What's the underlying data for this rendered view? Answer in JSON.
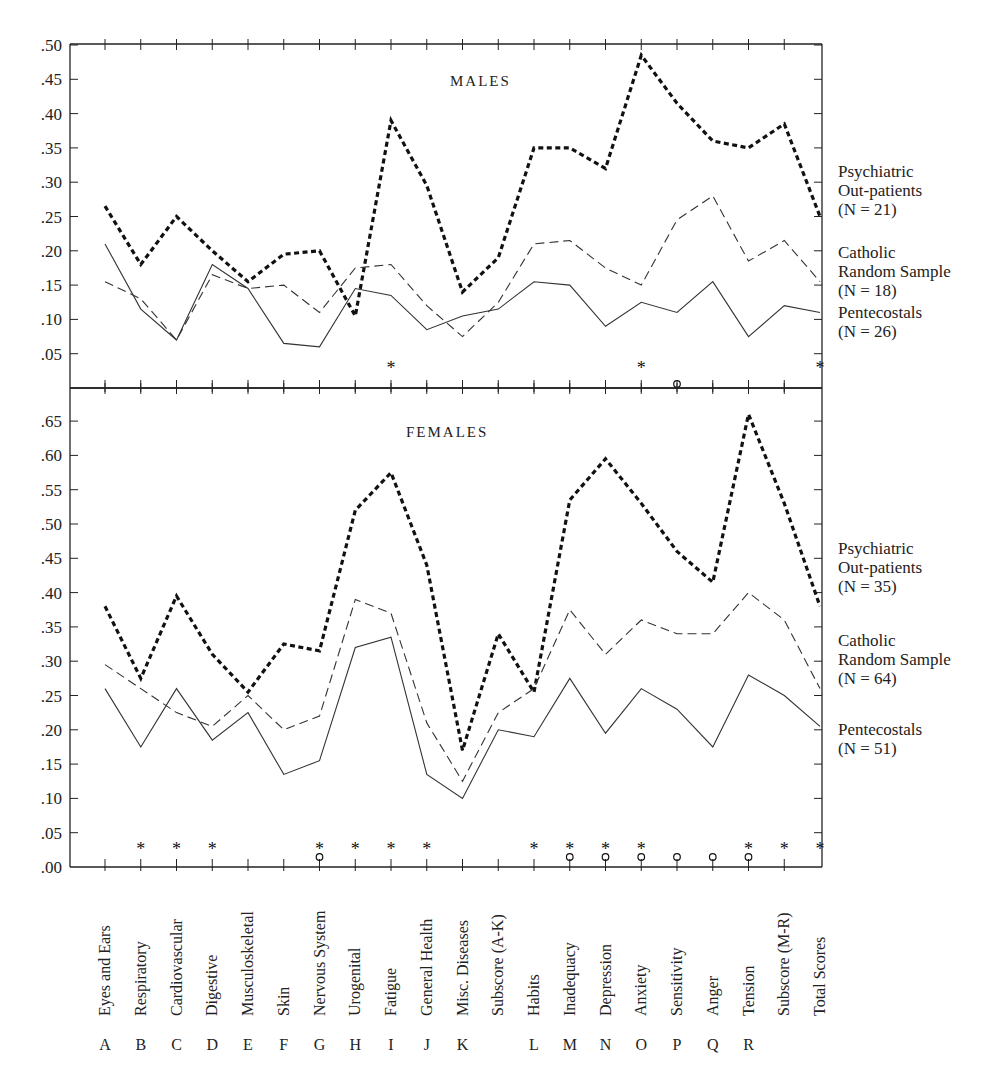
{
  "chart_data": [
    {
      "type": "line",
      "title": "MALES",
      "categories": [
        "Eyes and Ears",
        "Respiratory",
        "Cardiovascular",
        "Digestive",
        "Musculoskeletal",
        "Skin",
        "Nervous System",
        "Urogenital",
        "Fatigue",
        "General Health",
        "Misc. Diseases",
        "Subscore (A-K)",
        "Habits",
        "Inadequacy",
        "Depression",
        "Anxiety",
        "Sensitivity",
        "Anger",
        "Tension",
        "Subscore (M-R)",
        "Total Scores"
      ],
      "letters": [
        "A",
        "B",
        "C",
        "D",
        "E",
        "F",
        "G",
        "H",
        "I",
        "J",
        "K",
        "",
        "L",
        "M",
        "N",
        "O",
        "P",
        "Q",
        "R",
        "",
        ""
      ],
      "yticks": [
        ".05",
        ".10",
        ".15",
        ".20",
        ".25",
        ".30",
        ".35",
        ".40",
        ".45",
        ".50"
      ],
      "ylim": [
        0,
        0.5
      ],
      "series": [
        {
          "name": "Psychiatric Out-patients",
          "n_label": "(N = 21)",
          "line1": "Psychiatric",
          "line2": "Out-patients",
          "style": "heavy-dotted",
          "values": [
            0.265,
            0.18,
            0.25,
            0.2,
            0.155,
            0.195,
            0.2,
            0.105,
            0.39,
            0.295,
            0.14,
            0.19,
            0.35,
            0.35,
            0.32,
            0.485,
            0.415,
            0.36,
            0.35,
            0.385,
            0.25
          ]
        },
        {
          "name": "Catholic Random Sample",
          "n_label": "(N = 18)",
          "line1": "Catholic",
          "line2": "Random Sample",
          "style": "dashed",
          "values": [
            0.155,
            0.13,
            0.07,
            0.165,
            0.145,
            0.15,
            0.11,
            0.175,
            0.18,
            0.12,
            0.075,
            0.125,
            0.21,
            0.215,
            0.175,
            0.15,
            0.245,
            0.28,
            0.185,
            0.215,
            0.155
          ]
        },
        {
          "name": "Pentecostals",
          "n_label": "(N = 26)",
          "line1": "Pentecostals",
          "line2": "",
          "style": "solid",
          "values": [
            0.21,
            0.115,
            0.07,
            0.18,
            0.145,
            0.065,
            0.06,
            0.145,
            0.135,
            0.085,
            0.105,
            0.115,
            0.155,
            0.15,
            0.09,
            0.125,
            0.11,
            0.155,
            0.075,
            0.12,
            0.11
          ]
        }
      ],
      "significance": {
        "asterisk": [
          "Fatigue",
          "Anxiety",
          "Total Scores"
        ],
        "circle": [
          "Sensitivity"
        ]
      }
    },
    {
      "type": "line",
      "title": "FEMALES",
      "categories": [
        "Eyes and Ears",
        "Respiratory",
        "Cardiovascular",
        "Digestive",
        "Musculoskeletal",
        "Skin",
        "Nervous System",
        "Urogenital",
        "Fatigue",
        "General Health",
        "Misc. Diseases",
        "Subscore (A-K)",
        "Habits",
        "Inadequacy",
        "Depression",
        "Anxiety",
        "Sensitivity",
        "Anger",
        "Tension",
        "Subscore (M-R)",
        "Total Scores"
      ],
      "yticks": [
        ".00",
        ".05",
        ".10",
        ".15",
        ".20",
        ".25",
        ".30",
        ".35",
        ".40",
        ".45",
        ".50",
        ".55",
        ".60",
        ".65"
      ],
      "ylim": [
        0,
        0.68
      ],
      "series": [
        {
          "name": "Psychiatric Out-patients",
          "n_label": "(N = 35)",
          "line1": "Psychiatric",
          "line2": "Out-patients",
          "style": "heavy-dotted",
          "values": [
            0.38,
            0.275,
            0.395,
            0.31,
            0.255,
            0.325,
            0.315,
            0.52,
            0.575,
            0.44,
            0.17,
            0.34,
            0.255,
            0.535,
            0.595,
            0.53,
            0.46,
            0.415,
            0.66,
            0.53,
            0.38
          ]
        },
        {
          "name": "Catholic Random Sample",
          "n_label": "(N = 64)",
          "line1": "Catholic",
          "line2": "Random Sample",
          "style": "dashed",
          "values": [
            0.295,
            0.26,
            0.225,
            0.205,
            0.25,
            0.2,
            0.22,
            0.39,
            0.37,
            0.21,
            0.125,
            0.225,
            0.26,
            0.375,
            0.31,
            0.36,
            0.34,
            0.34,
            0.4,
            0.36,
            0.26
          ]
        },
        {
          "name": "Pentecostals",
          "n_label": "(N = 51)",
          "line1": "Pentecostals",
          "line2": "",
          "style": "solid",
          "values": [
            0.26,
            0.175,
            0.26,
            0.185,
            0.225,
            0.135,
            0.155,
            0.32,
            0.335,
            0.135,
            0.1,
            0.2,
            0.19,
            0.275,
            0.195,
            0.26,
            0.23,
            0.175,
            0.28,
            0.25,
            0.205
          ]
        }
      ],
      "significance": {
        "asterisk": [
          "Respiratory",
          "Cardiovascular",
          "Digestive",
          "Nervous System",
          "Urogenital",
          "Fatigue",
          "General Health",
          "Habits",
          "Inadequacy",
          "Depression",
          "Anxiety",
          "Tension",
          "Subscore (M-R)",
          "Total Scores"
        ],
        "circle": [
          "Nervous System",
          "Inadequacy",
          "Depression",
          "Anxiety",
          "Sensitivity",
          "Anger",
          "Tension"
        ]
      }
    }
  ]
}
